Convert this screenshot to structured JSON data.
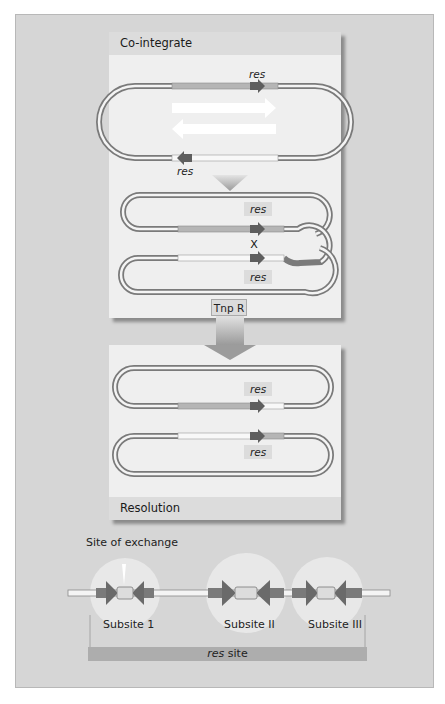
{
  "figure": {
    "panels": {
      "top": {
        "title": "Co-integrate"
      },
      "bottom": {
        "title": "Resolution"
      }
    },
    "labels": {
      "res": "res",
      "crossover": "X",
      "enzyme": "Tnp R",
      "site_of_exchange": "Site of exchange",
      "res_site_prefix": "res",
      "res_site_suffix": " site"
    },
    "subsites": [
      {
        "label": "Subsite 1"
      },
      {
        "label": "Subsite II"
      },
      {
        "label": "Subsite III"
      }
    ],
    "colors": {
      "background": "#d6d6d6",
      "panel": "#efefef",
      "panel_header": "#dcdcdc",
      "dna_tube": "#9a9a9a",
      "res_arrow": "#6e6e6e",
      "flow_arrow": "#a8a8a8",
      "subsite_circle": "#e6e6e6",
      "res_site_bar": "#adadad"
    }
  }
}
